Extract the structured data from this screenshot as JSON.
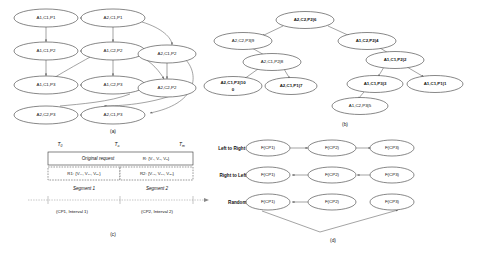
{
  "figure": {
    "panels": [
      {
        "id": "a",
        "label": "(a)"
      },
      {
        "id": "b",
        "label": "(b)"
      },
      {
        "id": "c",
        "label": "(c)"
      },
      {
        "id": "d",
        "label": "(d)"
      }
    ]
  },
  "panel_a": {
    "caption": "(a)",
    "nodes": [
      {
        "id": "a1c1p1",
        "label": "A1,C1,P1",
        "x": 46,
        "y": 18
      },
      {
        "id": "a2c1p1",
        "label": "A2,C1,P1",
        "x": 113,
        "y": 18
      },
      {
        "id": "a1c1p2",
        "label": "A1,C1,P2",
        "x": 46,
        "y": 51
      },
      {
        "id": "a1c2p2",
        "label": "A1,C2,P2",
        "x": 113,
        "y": 51
      },
      {
        "id": "a2c1p2",
        "label": "A2,C1,P2",
        "x": 167,
        "y": 54
      },
      {
        "id": "a1c1p3",
        "label": "A1,C1,P3",
        "x": 46,
        "y": 85
      },
      {
        "id": "a1c2p3",
        "label": "A1,C2,P3",
        "x": 113,
        "y": 85
      },
      {
        "id": "a2c2p2",
        "label": "A2,C2,P2",
        "x": 167,
        "y": 88
      },
      {
        "id": "a2c2p3",
        "label": "A2,C2,P3",
        "x": 46,
        "y": 115
      },
      {
        "id": "a2c1p3",
        "label": "A2,C1,P3",
        "x": 113,
        "y": 115
      }
    ]
  },
  "panel_b": {
    "caption": "(b)",
    "nodes": [
      {
        "id": "b_root",
        "label": "A2,C2,P2|6",
        "x": 305,
        "y": 20,
        "bold": true
      },
      {
        "id": "b_l1",
        "label": "A2,C2,P3|9",
        "x": 243,
        "y": 41,
        "bold": false
      },
      {
        "id": "b_l2",
        "label": "A2,C1,P2|8",
        "x": 272,
        "y": 62,
        "bold": false
      },
      {
        "id": "b_l3",
        "label": "A2,C1,P3|10",
        "x": 233,
        "y": 86,
        "bold": true,
        "line2": "0"
      },
      {
        "id": "b_l4",
        "label": "A2,C1,P1|7",
        "x": 291,
        "y": 86,
        "bold": true
      },
      {
        "id": "b_r1",
        "label": "A1,C2,P2|4",
        "x": 367,
        "y": 41,
        "bold": true
      },
      {
        "id": "b_r2",
        "label": "A1,C1,P2|2",
        "x": 395,
        "y": 60,
        "bold": true
      },
      {
        "id": "b_r3",
        "label": "A1,C1,P3|3",
        "x": 375,
        "y": 84,
        "bold": true
      },
      {
        "id": "b_r4",
        "label": "A1,C1,P1|1",
        "x": 435,
        "y": 84,
        "bold": true
      },
      {
        "id": "b_r5",
        "label": "A1,C2,P3|5",
        "x": 360,
        "y": 106,
        "bold": false
      }
    ]
  },
  "panel_c": {
    "caption": "(c)",
    "time_labels": [
      {
        "text": "T",
        "sub": "0",
        "x": 60,
        "y": 146
      },
      {
        "text": "T",
        "sub": "a",
        "x": 117,
        "y": 146
      },
      {
        "text": "T",
        "sub": "m",
        "x": 182,
        "y": 146
      }
    ],
    "original_request_label": "Original request",
    "original_request_value": "R: {V₁, V₂, V₃}",
    "r1_value": "R1: {V₁₁, V₂₁, V₃₁}",
    "r2_value": "R2: {V₁₂, V₂₂, V₃₂}",
    "segment1": "Segment 1",
    "segment2": "Segment 2",
    "cp1_label": "(CP1, Interval 1)",
    "cp2_label": "(CP2, Interval 2)"
  },
  "panel_d": {
    "caption": "(d)",
    "rows": [
      {
        "id": "ltr",
        "label": "Left to Right :",
        "direction": "right",
        "nodes": [
          {
            "label": "F(CP1)",
            "x": 268,
            "y": 148
          },
          {
            "label": "F(CP2)",
            "x": 332,
            "y": 148
          },
          {
            "label": "F(CP3)",
            "x": 392,
            "y": 148
          }
        ]
      },
      {
        "id": "rtl",
        "label": "Right to Left:",
        "direction": "left",
        "nodes": [
          {
            "label": "F(CP1)",
            "x": 268,
            "y": 175
          },
          {
            "label": "F(CP2)",
            "x": 332,
            "y": 175
          },
          {
            "label": "F(CP3)",
            "x": 392,
            "y": 175
          }
        ]
      },
      {
        "id": "rnd",
        "label": "Random:",
        "direction": "random",
        "nodes": [
          {
            "label": "F(CP1)",
            "x": 268,
            "y": 202
          },
          {
            "label": "F(CP2)",
            "x": 332,
            "y": 202
          },
          {
            "label": "F(CP3)",
            "x": 392,
            "y": 202
          }
        ]
      }
    ]
  },
  "colors": {
    "node_stroke": "#555555",
    "edge": "#666666",
    "text": "#111111",
    "background": "#ffffff"
  }
}
